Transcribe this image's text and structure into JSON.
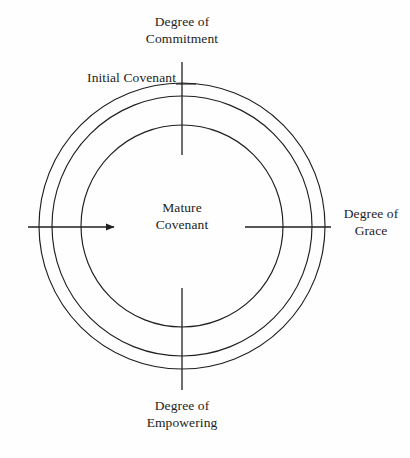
{
  "diagram": {
    "background_color": "#fefefe",
    "line_color": "#1f1f1f",
    "text_color": "#1d1d1d",
    "axes": {
      "top_label": "Degree of\nCommitment",
      "bottom_label": "Degree of\nEmpowering",
      "right_label": "Degree of\nGrace"
    },
    "annotations": {
      "outer_ring_label": "Initial Covenant",
      "center_label": "Mature\nCovenant"
    },
    "geometry": {
      "center_x": 182,
      "center_y": 226,
      "ring_radii": [
        143,
        130,
        101
      ],
      "ring_count": 3,
      "vertical_axis_x": 182,
      "vertical_axis_top_y1": 62,
      "vertical_axis_top_y2": 155,
      "vertical_axis_bottom_y1": 288,
      "vertical_axis_bottom_y2": 390,
      "horizontal_axis_y": 227,
      "arrow_start_x": 28,
      "arrow_tip_x": 120,
      "right_axis_x1": 245,
      "right_axis_x2": 331
    }
  }
}
